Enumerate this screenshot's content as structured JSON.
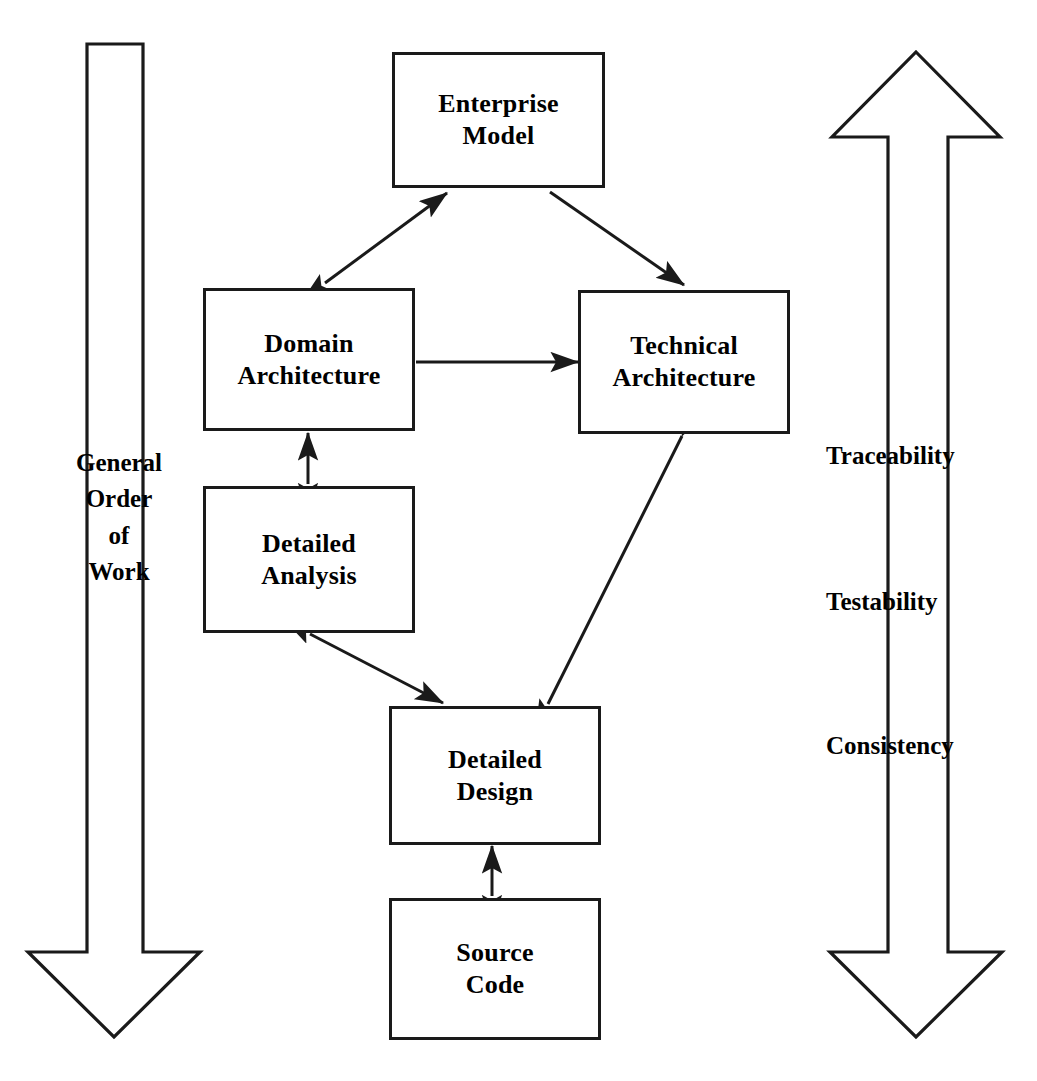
{
  "diagram": {
    "type": "block-flow-diagram",
    "background_color": "#ffffff",
    "line_color": "#1a1a1a",
    "text_color": "#000000",
    "nodes": [
      {
        "id": "enterprise-model",
        "label": "Enterprise\nModel",
        "x": 392,
        "y": 52,
        "width": 213,
        "height": 136
      },
      {
        "id": "domain-architecture",
        "label": "Domain\nArchitecture",
        "x": 203,
        "y": 288,
        "width": 212,
        "height": 143
      },
      {
        "id": "technical-architecture",
        "label": "Technical\nArchitecture",
        "x": 578,
        "y": 290,
        "width": 212,
        "height": 144
      },
      {
        "id": "detailed-analysis",
        "label": "Detailed\nAnalysis",
        "x": 203,
        "y": 486,
        "width": 212,
        "height": 147
      },
      {
        "id": "detailed-design",
        "label": "Detailed\nDesign",
        "x": 389,
        "y": 706,
        "width": 212,
        "height": 139
      },
      {
        "id": "source-code",
        "label": "Source\nCode",
        "x": 389,
        "y": 898,
        "width": 212,
        "height": 142
      }
    ],
    "connectors": [
      {
        "id": "enterprise-to-domain",
        "from": "enterprise-model",
        "to": "domain-architecture",
        "style": "double-headed-diagonal"
      },
      {
        "id": "enterprise-to-technical",
        "from": "enterprise-model",
        "to": "technical-architecture",
        "style": "single-headed-diagonal"
      },
      {
        "id": "domain-to-technical",
        "from": "domain-architecture",
        "to": "technical-architecture",
        "style": "single-headed-horizontal"
      },
      {
        "id": "domain-to-detailed-analysis",
        "from": "domain-architecture",
        "to": "detailed-analysis",
        "style": "double-headed-vertical"
      },
      {
        "id": "detailed-analysis-to-design",
        "from": "detailed-analysis",
        "to": "detailed-design",
        "style": "double-headed-diagonal"
      },
      {
        "id": "technical-to-detailed-design",
        "from": "technical-architecture",
        "to": "detailed-design",
        "style": "double-headed-diagonal"
      },
      {
        "id": "detailed-design-to-source-code",
        "from": "detailed-design",
        "to": "source-code",
        "style": "double-headed-vertical"
      }
    ],
    "left_arrow": {
      "name": "general-order-of-work-arrow",
      "direction": "down",
      "label": "General\nOrder\nof\nWork"
    },
    "right_arrow": {
      "name": "quality-attributes-arrow",
      "direction": "up-and-down",
      "labels": [
        "Traceability",
        "Testability",
        "Consistency"
      ]
    }
  }
}
